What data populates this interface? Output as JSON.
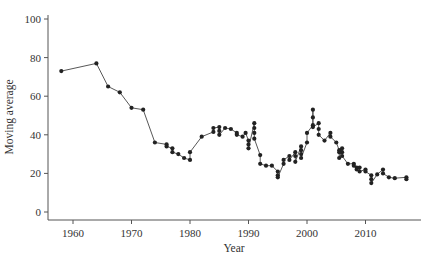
{
  "chart_data": {
    "type": "line",
    "title": "",
    "xlabel": "Year",
    "ylabel": "Moving average",
    "xlim": [
      1955.5,
      2019
    ],
    "ylim": [
      -3,
      101
    ],
    "x_ticks": [
      1960,
      1970,
      1980,
      1990,
      2000,
      2010
    ],
    "y_ticks": [
      0,
      20,
      40,
      60,
      80,
      100
    ],
    "grid": false,
    "legend": null,
    "marker": "circle",
    "color": "#222222",
    "series": [
      {
        "name": "Moving average",
        "points": [
          [
            1958,
            73
          ],
          [
            1964,
            77
          ],
          [
            1966,
            65
          ],
          [
            1968,
            62
          ],
          [
            1970,
            54
          ],
          [
            1972,
            53
          ],
          [
            1974,
            36
          ],
          [
            1976,
            35
          ],
          [
            1976,
            34
          ],
          [
            1977,
            33
          ],
          [
            1977,
            31
          ],
          [
            1978,
            30
          ],
          [
            1979,
            28
          ],
          [
            1980,
            27
          ],
          [
            1980,
            31
          ],
          [
            1982,
            39
          ],
          [
            1984,
            41.5
          ],
          [
            1984,
            43.5
          ],
          [
            1985,
            44
          ],
          [
            1985,
            42
          ],
          [
            1985,
            40
          ],
          [
            1986,
            43.5
          ],
          [
            1987,
            43
          ],
          [
            1988,
            41
          ],
          [
            1988,
            40
          ],
          [
            1989,
            39
          ],
          [
            1989.5,
            41
          ],
          [
            1990,
            37
          ],
          [
            1990,
            35
          ],
          [
            1990,
            33
          ],
          [
            1991,
            46
          ],
          [
            1991,
            43.5
          ],
          [
            1991,
            41
          ],
          [
            1991,
            38
          ],
          [
            1992,
            29.5
          ],
          [
            1992,
            25
          ],
          [
            1993,
            24
          ],
          [
            1994,
            24
          ],
          [
            1995,
            21
          ],
          [
            1995,
            19
          ],
          [
            1995,
            18
          ],
          [
            1996,
            25
          ],
          [
            1996,
            27
          ],
          [
            1997,
            29
          ],
          [
            1997,
            27
          ],
          [
            1998,
            31
          ],
          [
            1998,
            29
          ],
          [
            1998,
            26
          ],
          [
            1999,
            34
          ],
          [
            1999,
            32
          ],
          [
            1999,
            30
          ],
          [
            1999,
            28
          ],
          [
            2000,
            36
          ],
          [
            2000,
            41
          ],
          [
            2001,
            45
          ],
          [
            2001,
            53
          ],
          [
            2001,
            49
          ],
          [
            2001,
            44
          ],
          [
            2002,
            46
          ],
          [
            2002,
            43
          ],
          [
            2002,
            40
          ],
          [
            2003,
            37
          ],
          [
            2004,
            41
          ],
          [
            2004,
            39
          ],
          [
            2005,
            36
          ],
          [
            2005.5,
            32
          ],
          [
            2005.5,
            31
          ],
          [
            2005.5,
            28
          ],
          [
            2006,
            33
          ],
          [
            2006,
            31
          ],
          [
            2006,
            29
          ],
          [
            2007,
            25
          ],
          [
            2008,
            25
          ],
          [
            2008,
            24
          ],
          [
            2008.5,
            23
          ],
          [
            2008.5,
            22
          ],
          [
            2009,
            23
          ],
          [
            2009,
            21
          ],
          [
            2010,
            22
          ],
          [
            2010,
            21
          ],
          [
            2011,
            19
          ],
          [
            2011,
            17
          ],
          [
            2011,
            15
          ],
          [
            2012,
            19.5
          ],
          [
            2013,
            22
          ],
          [
            2013,
            20
          ],
          [
            2014,
            18
          ],
          [
            2015,
            17.5
          ],
          [
            2017,
            18
          ],
          [
            2017,
            17
          ]
        ]
      }
    ]
  }
}
